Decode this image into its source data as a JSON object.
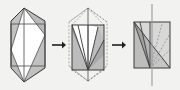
{
  "figure": {
    "width": 180,
    "height": 90,
    "background_color": "#f2f2f0",
    "stroke_color": "#3a3a3a",
    "dashed_color": "#8d8d8d",
    "fill_light": "#ffffff",
    "fill_shade": "#b6b6b6",
    "fill_shade_dark": "#9a9a9a",
    "arrow_color": "#1f1f1f",
    "panel_count": 3,
    "arrow_count": 2,
    "arrow_labels": [
      "arrow-1",
      "arrow-2"
    ]
  },
  "chart_data": {
    "type": "diagram",
    "panels": [
      {
        "name": "panel-1-hexagon",
        "caption": "",
        "outer_shape": "hexagon",
        "outer_vertices": [
          [
            24,
            8
          ],
          [
            45,
            21
          ],
          [
            45,
            68
          ],
          [
            24,
            82
          ],
          [
            11,
            68
          ],
          [
            11,
            21
          ]
        ],
        "inner_shapes": [
          "square",
          "diamond"
        ],
        "square_vertices": [
          [
            11,
            24
          ],
          [
            45,
            24
          ],
          [
            45,
            66
          ],
          [
            11,
            66
          ]
        ],
        "diamond_vertices": [
          [
            24,
            8
          ],
          [
            45,
            35
          ],
          [
            24,
            82
          ],
          [
            11,
            50
          ]
        ],
        "vertical_axis": [
          [
            24,
            8
          ],
          [
            24,
            82
          ]
        ],
        "shaded_regions": 4
      },
      {
        "name": "panel-2-collapsing",
        "caption": "",
        "outer_shape": "square-with-dashed-hexagon",
        "square_vertices": [
          [
            72,
            25
          ],
          [
            104,
            25
          ],
          [
            104,
            70
          ],
          [
            72,
            70
          ]
        ],
        "dashed_hexagon_vertices": [
          [
            88,
            8
          ],
          [
            107,
            22
          ],
          [
            107,
            66
          ],
          [
            88,
            81
          ],
          [
            69,
            66
          ],
          [
            69,
            22
          ]
        ],
        "fan_apex": [
          88,
          70
        ],
        "fan_rays": [
          [
            72,
            25
          ],
          [
            78,
            25
          ],
          [
            88,
            25
          ],
          [
            98,
            27
          ],
          [
            104,
            40
          ],
          [
            104,
            55
          ]
        ],
        "vertical_axis": [
          [
            88,
            8
          ],
          [
            88,
            81
          ]
        ],
        "shaded_regions": 4
      },
      {
        "name": "panel-3-final",
        "caption": "",
        "outer_shape": "square",
        "square_vertices": [
          [
            134,
            22
          ],
          [
            170,
            22
          ],
          [
            170,
            68
          ],
          [
            134,
            68
          ]
        ],
        "fan_apex": [
          150,
          68
        ],
        "fan_rays_solid": [
          [
            134,
            22
          ],
          [
            140,
            22
          ],
          [
            150,
            22
          ]
        ],
        "fan_rays_dashed": [
          [
            162,
            24
          ],
          [
            170,
            34
          ],
          [
            170,
            50
          ]
        ],
        "diagonal": [
          [
            134,
            22
          ],
          [
            170,
            68
          ]
        ],
        "vertical_axis": [
          [
            152,
            4
          ],
          [
            152,
            86
          ]
        ],
        "shaded_regions": 2
      }
    ],
    "arrows": [
      {
        "name": "arrow-1",
        "from_panel": 0,
        "to_panel": 1,
        "x": 57,
        "y": 45
      },
      {
        "name": "arrow-2",
        "from_panel": 1,
        "to_panel": 2,
        "x": 117,
        "y": 45
      }
    ]
  }
}
